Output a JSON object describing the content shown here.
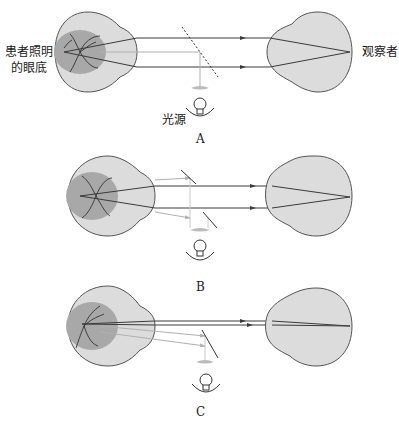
{
  "labels": {
    "patient": [
      "患者照明",
      "的眼底"
    ],
    "observer": "观察者",
    "light_source": "光源"
  },
  "panels": [
    {
      "id": "A",
      "label": "A"
    },
    {
      "id": "B",
      "label": "B"
    },
    {
      "id": "C",
      "label": "C"
    }
  ],
  "colors": {
    "eye_fill": "#dcdcdc",
    "fundus_fill": "#a8a8a8",
    "ray_dark": "#3a3a3a",
    "ray_light": "#b0b0b0",
    "outline": "#555555"
  }
}
